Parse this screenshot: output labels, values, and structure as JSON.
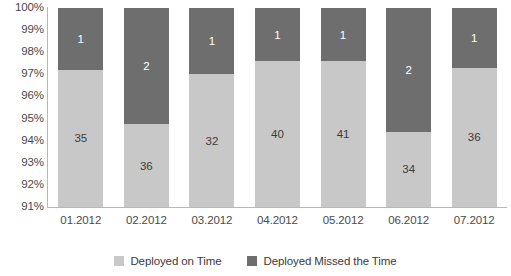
{
  "chart_data": {
    "type": "bar",
    "title": "",
    "subtitle": "",
    "xlabel": "",
    "ylabel": "",
    "stacked": true,
    "orientation": "vertical",
    "grid": false,
    "legend_position": "bottom",
    "ylim": [
      91,
      100
    ],
    "ytick_labels": [
      "100%",
      "99%",
      "98%",
      "97%",
      "96%",
      "95%",
      "94%",
      "93%",
      "92%",
      "91%"
    ],
    "ytick_values": [
      100,
      99,
      98,
      97,
      96,
      95,
      94,
      93,
      92,
      91
    ],
    "categories": [
      "01.2012",
      "02.2012",
      "03.2012",
      "04.2012",
      "05.2012",
      "06.2012",
      "07.2012"
    ],
    "series": [
      {
        "name": "Deployed on Time",
        "color": "#c8c8c8",
        "values": [
          35,
          36,
          32,
          40,
          41,
          34,
          36
        ],
        "percent_top": [
          97.2,
          94.75,
          97.0,
          97.6,
          97.6,
          94.4,
          97.3
        ]
      },
      {
        "name": "Deployed Missed the Time",
        "color": "#6e6e6e",
        "values": [
          1,
          2,
          1,
          1,
          1,
          2,
          1
        ],
        "percent_top": [
          100,
          100,
          100,
          100,
          100,
          100,
          100
        ]
      }
    ]
  },
  "legend": {
    "items": [
      {
        "label": "Deployed on Time",
        "color": "#c8c8c8"
      },
      {
        "label": "Deployed Missed the Time",
        "color": "#6e6e6e"
      }
    ]
  }
}
